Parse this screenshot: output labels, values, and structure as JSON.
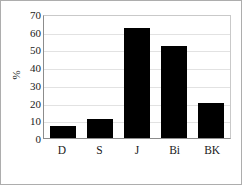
{
  "chart_data": {
    "type": "bar",
    "title": "",
    "xlabel": "",
    "ylabel": "%",
    "categories": [
      "D",
      "S",
      "J",
      "Bi",
      "BK"
    ],
    "values": [
      7,
      11,
      62,
      52,
      20
    ],
    "ylim": [
      0,
      70
    ],
    "ytick_values": [
      70,
      60,
      50,
      40,
      30,
      20,
      10,
      0
    ],
    "ytick_labels": [
      "70",
      "60",
      "50",
      "40",
      "30",
      "20",
      "10",
      "0"
    ],
    "grid": true,
    "legend": false,
    "bar_color": "#000000",
    "grid_color": "#e2e2e2",
    "axis_color": "#8c8c8c"
  }
}
